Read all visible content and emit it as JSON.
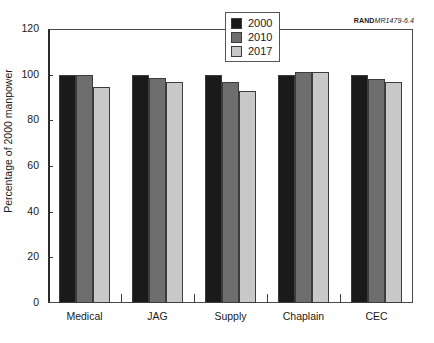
{
  "credit": {
    "rand": "RAND",
    "number": "MR1479-6.4"
  },
  "chart_data": {
    "type": "bar",
    "title": "",
    "xlabel": "",
    "ylabel": "Percentage of 2000 manpower",
    "categories": [
      "Medical",
      "JAG",
      "Supply",
      "Chaplain",
      "CEC"
    ],
    "ylim": [
      0,
      120
    ],
    "yticks": [
      0,
      20,
      40,
      60,
      80,
      100,
      120
    ],
    "ytick_labels": [
      "0",
      "20",
      "40",
      "60",
      "80",
      "100",
      "120"
    ],
    "grid": false,
    "legend_position": "top-center",
    "series": [
      {
        "name": "2000",
        "color": "#1a1a1a",
        "values": [
          100,
          100,
          100,
          100,
          100
        ]
      },
      {
        "name": "2010",
        "color": "#6e6e6e",
        "values": [
          100,
          98.5,
          97,
          101,
          98
        ]
      },
      {
        "name": "2017",
        "color": "#c8c8c8",
        "values": [
          94.5,
          97,
          93,
          101,
          97
        ]
      }
    ]
  },
  "legend": {
    "items": [
      {
        "label": "2000",
        "color": "#1a1a1a"
      },
      {
        "label": "2010",
        "color": "#6e6e6e"
      },
      {
        "label": "2017",
        "color": "#c8c8c8"
      }
    ]
  }
}
